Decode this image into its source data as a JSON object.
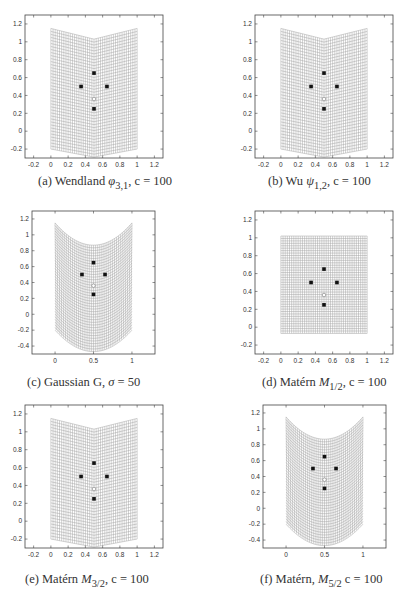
{
  "chart_data": [
    {
      "id": "a",
      "type": "scatter",
      "title": "(a) Wendland φ3,1, c = 100",
      "caption": {
        "prefix": "(a) Wendland ",
        "symbol": "φ",
        "sub": "3,1",
        "suffix": ", c = 100"
      },
      "xlim": [
        -0.3,
        1.3
      ],
      "ylim": [
        -0.3,
        1.3
      ],
      "xticks": [
        -0.2,
        0,
        0.2,
        0.4,
        0.6,
        0.8,
        1,
        1.2
      ],
      "yticks": [
        -0.2,
        0,
        0.2,
        0.4,
        0.6,
        0.8,
        1,
        1.2
      ],
      "grid": {
        "shape": "chevron",
        "top_edge": [
          1.15,
          1.03,
          1.15
        ],
        "bottom_edge": [
          -0.2,
          -0.29,
          -0.2
        ],
        "x_range": [
          0,
          1
        ]
      },
      "points": [
        [
          0.5,
          0.65
        ],
        [
          0.35,
          0.5
        ],
        [
          0.65,
          0.5
        ],
        [
          0.5,
          0.25
        ]
      ],
      "center_marker": [
        0.5,
        0.36
      ],
      "box": {
        "x": 25,
        "y": 15,
        "w": 138,
        "h": 143
      }
    },
    {
      "id": "b",
      "type": "scatter",
      "title": "(b) Wu ψ1,2, c = 100",
      "caption": {
        "prefix": "(b) Wu ",
        "symbol": "ψ",
        "sub": "1,2",
        "suffix": ", c = 100"
      },
      "xlim": [
        -0.3,
        1.3
      ],
      "ylim": [
        -0.3,
        1.3
      ],
      "xticks": [
        -0.2,
        0,
        0.2,
        0.4,
        0.6,
        0.8,
        1,
        1.2
      ],
      "yticks": [
        -0.2,
        0,
        0.2,
        0.4,
        0.6,
        0.8,
        1,
        1.2
      ],
      "grid": {
        "shape": "chevron",
        "top_edge": [
          1.15,
          1.03,
          1.15
        ],
        "bottom_edge": [
          -0.2,
          -0.29,
          -0.2
        ],
        "x_range": [
          0,
          1
        ]
      },
      "points": [
        [
          0.5,
          0.65
        ],
        [
          0.35,
          0.5
        ],
        [
          0.65,
          0.5
        ],
        [
          0.5,
          0.25
        ]
      ],
      "center_marker": [
        0.5,
        0.36
      ],
      "box": {
        "x": 255,
        "y": 15,
        "w": 138,
        "h": 143
      }
    },
    {
      "id": "c",
      "type": "scatter",
      "title": "(c) Gaussian G, σ = 50",
      "caption": {
        "prefix": "(c) Gaussian G, ",
        "symbol": "σ",
        "sub": "",
        "suffix": " = 50"
      },
      "xlim": [
        -0.3,
        1.3
      ],
      "ylim": [
        -0.5,
        1.3
      ],
      "xticks": [
        0,
        0.5,
        1
      ],
      "yticks": [
        -0.4,
        -0.2,
        0,
        0.2,
        0.4,
        0.6,
        0.8,
        1,
        1.2
      ],
      "grid": {
        "shape": "parabola",
        "top_edge": [
          1.15,
          0.87,
          1.15
        ],
        "bottom_edge": [
          -0.2,
          -0.47,
          -0.2
        ],
        "x_range": [
          0,
          1
        ]
      },
      "points": [
        [
          0.5,
          0.65
        ],
        [
          0.35,
          0.5
        ],
        [
          0.65,
          0.5
        ],
        [
          0.5,
          0.25
        ]
      ],
      "center_marker": [
        0.5,
        0.36
      ],
      "box": {
        "x": 32,
        "y": 211,
        "w": 123,
        "h": 143
      }
    },
    {
      "id": "d",
      "type": "scatter",
      "title": "(d) Matérn M1/2, c = 100",
      "caption": {
        "prefix": "(d) Matérn ",
        "symbol": "M",
        "sub": "1/2",
        "suffix": ", c = 100"
      },
      "xlim": [
        -0.3,
        1.3
      ],
      "ylim": [
        -0.3,
        1.3
      ],
      "xticks": [
        -0.2,
        0,
        0.2,
        0.4,
        0.6,
        0.8,
        1,
        1.2
      ],
      "yticks": [
        -0.2,
        0,
        0.2,
        0.4,
        0.6,
        0.8,
        1,
        1.2
      ],
      "grid": {
        "shape": "square",
        "top_edge": [
          1.02,
          1.02,
          1.02
        ],
        "bottom_edge": [
          -0.07,
          -0.07,
          -0.07
        ],
        "x_range": [
          0,
          1
        ]
      },
      "points": [
        [
          0.5,
          0.65
        ],
        [
          0.35,
          0.5
        ],
        [
          0.65,
          0.5
        ],
        [
          0.5,
          0.25
        ]
      ],
      "center_marker": [
        0.5,
        0.36
      ],
      "box": {
        "x": 255,
        "y": 211,
        "w": 138,
        "h": 143
      }
    },
    {
      "id": "e",
      "type": "scatter",
      "title": "(e) Matérn M3/2, c = 100",
      "caption": {
        "prefix": "(e) Matérn ",
        "symbol": "M",
        "sub": "3/2",
        "suffix": ", c = 100"
      },
      "xlim": [
        -0.3,
        1.3
      ],
      "ylim": [
        -0.3,
        1.3
      ],
      "xticks": [
        -0.2,
        0,
        0.2,
        0.4,
        0.6,
        0.8,
        1,
        1.2
      ],
      "yticks": [
        -0.2,
        0,
        0.2,
        0.4,
        0.6,
        0.8,
        1,
        1.2
      ],
      "grid": {
        "shape": "chevron",
        "top_edge": [
          1.15,
          1.03,
          1.15
        ],
        "bottom_edge": [
          -0.2,
          -0.29,
          -0.2
        ],
        "x_range": [
          0,
          1
        ]
      },
      "points": [
        [
          0.5,
          0.65
        ],
        [
          0.35,
          0.5
        ],
        [
          0.65,
          0.5
        ],
        [
          0.5,
          0.25
        ]
      ],
      "center_marker": [
        0.5,
        0.36
      ],
      "box": {
        "x": 25,
        "y": 405,
        "w": 138,
        "h": 143
      }
    },
    {
      "id": "f",
      "type": "scatter",
      "title": "(f) Matérn, M5/2 c = 100",
      "caption": {
        "prefix": "(f) Matérn, ",
        "symbol": "M",
        "sub": "5/2",
        "suffix": " c = 100"
      },
      "xlim": [
        -0.3,
        1.3
      ],
      "ylim": [
        -0.5,
        1.3
      ],
      "xticks": [
        0,
        0.5,
        1
      ],
      "yticks": [
        -0.4,
        -0.2,
        0,
        0.2,
        0.4,
        0.6,
        0.8,
        1,
        1.2
      ],
      "grid": {
        "shape": "parabola",
        "top_edge": [
          1.15,
          0.87,
          1.15
        ],
        "bottom_edge": [
          -0.2,
          -0.47,
          -0.2
        ],
        "x_range": [
          0,
          1
        ]
      },
      "points": [
        [
          0.5,
          0.65
        ],
        [
          0.35,
          0.5
        ],
        [
          0.65,
          0.5
        ],
        [
          0.5,
          0.25
        ]
      ],
      "center_marker": [
        0.5,
        0.36
      ],
      "box": {
        "x": 263,
        "y": 405,
        "w": 123,
        "h": 143
      }
    }
  ],
  "captions": {
    "a": {
      "prefix": "(a) Wendland ",
      "symbol": "φ",
      "sub": "3,1",
      "suffix": ", c = 100"
    },
    "b": {
      "prefix": "(b) Wu ",
      "symbol": "ψ",
      "sub": "1,2",
      "suffix": ", c = 100"
    },
    "c": {
      "prefix": "(c) Gaussian G, ",
      "symbol": "σ",
      "sub": "",
      "suffix": " = 50"
    },
    "d": {
      "prefix": "(d) Matérn ",
      "symbol": "M",
      "sub": "1/2",
      "suffix": ", c = 100"
    },
    "e": {
      "prefix": "(e) Matérn ",
      "symbol": "M",
      "sub": "3/2",
      "suffix": ", c = 100"
    },
    "f": {
      "prefix": "(f) Matérn, ",
      "symbol": "M",
      "sub": "5/2",
      "suffix": " c = 100"
    }
  },
  "colors": {
    "axis": "#444444",
    "grid_line": "#9a9a9a",
    "point": "#111111",
    "center": "#888888"
  }
}
